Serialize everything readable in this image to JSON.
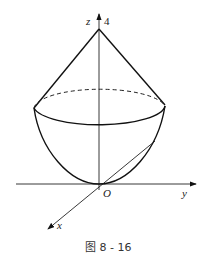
{
  "figure": {
    "caption": "图 8 - 16",
    "labels": {
      "z_axis": "z",
      "z_value": "4",
      "y_axis": "y",
      "x_axis": "x",
      "origin": "O"
    }
  }
}
